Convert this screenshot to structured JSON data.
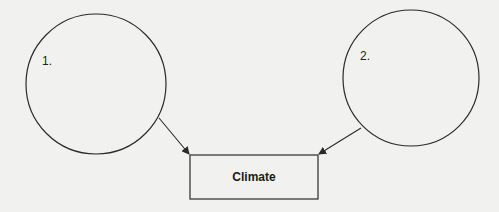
{
  "diagram": {
    "nodes": [
      {
        "id": "circle-1",
        "shape": "circle",
        "label": "1.",
        "content": ""
      },
      {
        "id": "circle-2",
        "shape": "circle",
        "label": "2.",
        "content": ""
      },
      {
        "id": "climate-box",
        "shape": "rectangle",
        "label": "Climate"
      }
    ],
    "edges": [
      {
        "from": "circle-1",
        "to": "climate-box"
      },
      {
        "from": "circle-2",
        "to": "climate-box"
      }
    ],
    "colors": {
      "stroke": "#2a2a2a",
      "background": "#f1f1ef"
    }
  }
}
